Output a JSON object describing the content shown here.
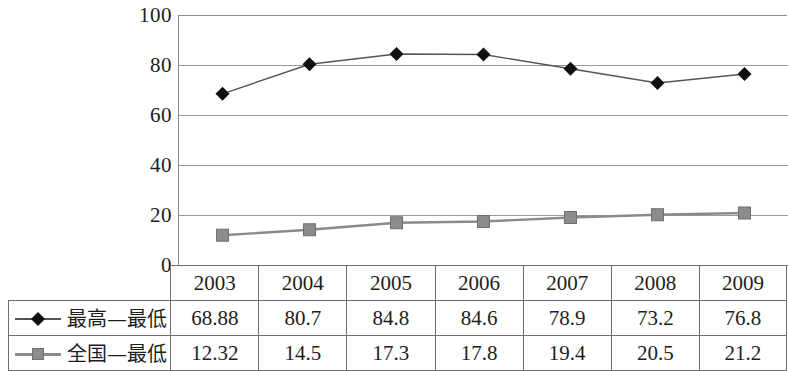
{
  "chart_data": {
    "type": "line",
    "title": "",
    "xlabel": "",
    "ylabel": "",
    "ylim": [
      0,
      100
    ],
    "yticks": [
      100,
      80,
      60,
      40,
      20,
      0
    ],
    "grid": true,
    "legend_position": "table-left",
    "categories": [
      "2003",
      "2004",
      "2005",
      "2006",
      "2007",
      "2008",
      "2009"
    ],
    "series": [
      {
        "name": "最高—最低",
        "marker": "diamond",
        "color": "#101010",
        "line_color": "#555555",
        "values": [
          68.88,
          80.7,
          84.8,
          84.6,
          78.9,
          73.2,
          76.8
        ],
        "value_labels": [
          "68.88",
          "80.7",
          "84.8",
          "84.6",
          "78.9",
          "73.2",
          "76.8"
        ]
      },
      {
        "name": "全国—最低",
        "marker": "square",
        "color": "#8c8c8c",
        "line_color": "#8a8a8a",
        "values": [
          12.32,
          14.5,
          17.3,
          17.8,
          19.4,
          20.5,
          21.2
        ],
        "value_labels": [
          "12.32",
          "14.5",
          "17.3",
          "17.8",
          "19.4",
          "20.5",
          "21.2"
        ]
      }
    ]
  },
  "axis": {
    "tick_100": "100",
    "tick_80": "80",
    "tick_60": "60",
    "tick_40": "40",
    "tick_20": "20",
    "tick_0": "0"
  },
  "table": {
    "header_blank": "",
    "years": {
      "y2003": "2003",
      "y2004": "2004",
      "y2005": "2005",
      "y2006": "2006",
      "y2007": "2007",
      "y2008": "2008",
      "y2009": "2009"
    },
    "row1": {
      "label": "最高—最低",
      "c2003": "68.88",
      "c2004": "80.7",
      "c2005": "84.8",
      "c2006": "84.6",
      "c2007": "78.9",
      "c2008": "73.2",
      "c2009": "76.8"
    },
    "row2": {
      "label": "全国—最低",
      "c2003": "12.32",
      "c2004": "14.5",
      "c2005": "17.3",
      "c2006": "17.8",
      "c2007": "19.4",
      "c2008": "20.5",
      "c2009": "21.2"
    }
  }
}
